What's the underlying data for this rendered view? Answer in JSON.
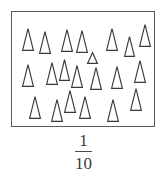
{
  "figure": {
    "name": "triangle-count-figure",
    "box": {
      "border_color": "#5b5b5b",
      "fill_color": "#ffffff",
      "x": 11,
      "y": 11,
      "width": 144,
      "height": 116
    },
    "marks": {
      "glyph": "triangle",
      "icon_name": "triangle-outline-icon",
      "stroke_color": "#3a3a3a",
      "fill_color": "#ffffff",
      "count": 21,
      "items": [
        {
          "x": 10,
          "y": 16,
          "w": 12,
          "h": 23
        },
        {
          "x": 27,
          "y": 19,
          "w": 12,
          "h": 23
        },
        {
          "x": 49,
          "y": 17,
          "w": 12,
          "h": 23
        },
        {
          "x": 64,
          "y": 18,
          "w": 12,
          "h": 23
        },
        {
          "x": 94,
          "y": 16,
          "w": 12,
          "h": 23
        },
        {
          "x": 112,
          "y": 24,
          "w": 11,
          "h": 21
        },
        {
          "x": 127,
          "y": 12,
          "w": 12,
          "h": 23
        },
        {
          "x": 10,
          "y": 52,
          "w": 12,
          "h": 23
        },
        {
          "x": 34,
          "y": 50,
          "w": 12,
          "h": 23
        },
        {
          "x": 47,
          "y": 47,
          "w": 11,
          "h": 22
        },
        {
          "x": 59,
          "y": 53,
          "w": 12,
          "h": 23
        },
        {
          "x": 78,
          "y": 55,
          "w": 12,
          "h": 23
        },
        {
          "x": 99,
          "y": 54,
          "w": 12,
          "h": 23
        },
        {
          "x": 122,
          "y": 48,
          "w": 12,
          "h": 23
        },
        {
          "x": 17,
          "y": 84,
          "w": 12,
          "h": 23
        },
        {
          "x": 39,
          "y": 87,
          "w": 12,
          "h": 23
        },
        {
          "x": 52,
          "y": 78,
          "w": 12,
          "h": 23
        },
        {
          "x": 67,
          "y": 84,
          "w": 12,
          "h": 23
        },
        {
          "x": 95,
          "y": 87,
          "w": 12,
          "h": 23
        },
        {
          "x": 118,
          "y": 76,
          "w": 12,
          "h": 23
        },
        {
          "x": 75,
          "y": 40,
          "w": 11,
          "h": 12
        }
      ]
    }
  },
  "label": {
    "type": "fraction",
    "numerator": "1",
    "denominator": "10",
    "text": "1/10",
    "color": "#3c3c3c"
  }
}
